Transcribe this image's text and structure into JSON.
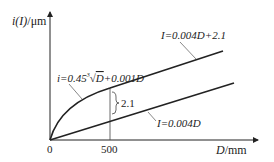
{
  "diagram": {
    "y_axis_label": {
      "italic_part": "i(I)",
      "unit": "/μm"
    },
    "x_axis_label": {
      "italic_part": "D",
      "unit": "/mm"
    },
    "origin_label": "0",
    "x_tick_label": "500",
    "curve_formula": {
      "prefix": "i=0.45",
      "root_index": "3",
      "radicand": "D",
      "suffix": "+0.001D"
    },
    "upper_line_formula": "I=0.004D+2.1",
    "lower_line_formula": "I=0.004D",
    "gap_label": "2.1"
  },
  "colors": {
    "line": "#222222",
    "leader": "#555555",
    "background": "#ffffff"
  }
}
